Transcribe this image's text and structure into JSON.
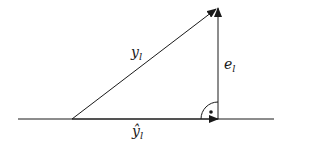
{
  "diagram": {
    "type": "vector-projection",
    "labels": {
      "hypotenuse": {
        "base": "y",
        "sub": "l"
      },
      "vertical": {
        "base": "e",
        "sub": "l"
      },
      "baseline": {
        "base": "ŷ",
        "sub": "l"
      }
    },
    "right_angle_marker": "arc-with-dot",
    "colors": {
      "stroke": "#1a1a1a",
      "background": "#ffffff"
    }
  }
}
